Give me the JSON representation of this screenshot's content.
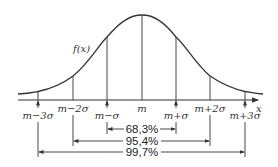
{
  "diagram": {
    "type": "normal-distribution",
    "curve_label": "f(x)",
    "axis_label": "x",
    "colors": {
      "stroke": "#333333",
      "background": "#ffffff"
    },
    "ticks": [
      {
        "label": "m−3σ",
        "x": 38,
        "arrow": true
      },
      {
        "label": "m−2σ",
        "x": 73,
        "arrow": false
      },
      {
        "label": "m−σ",
        "x": 107,
        "arrow": true
      },
      {
        "label": "m",
        "x": 142,
        "arrow": false
      },
      {
        "label": "m+σ",
        "x": 176,
        "arrow": true
      },
      {
        "label": "m+2σ",
        "x": 210,
        "arrow": false
      },
      {
        "label": "m+3σ",
        "x": 245,
        "arrow": true
      }
    ],
    "intervals": [
      {
        "label": "68,3%",
        "from": "m−σ",
        "to": "m+σ"
      },
      {
        "label": "95,4%",
        "from": "m−2σ",
        "to": "m+2σ"
      },
      {
        "label": "99,7%",
        "from": "m−3σ",
        "to": "m+3σ"
      }
    ]
  }
}
